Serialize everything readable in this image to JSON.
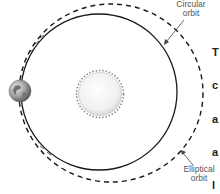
{
  "diagram": {
    "type": "orbit-comparison",
    "labels": {
      "circular": [
        "Circular",
        "orbit"
      ],
      "elliptical": [
        "Elliptical",
        "orbit"
      ]
    },
    "bodies": {
      "sun": {
        "name": "sun",
        "cx": 100,
        "cy": 94,
        "r": 22
      },
      "earth": {
        "name": "earth",
        "cx": 20,
        "cy": 91,
        "r": 11
      }
    },
    "orbits": {
      "circular": {
        "style": "solid",
        "cx": 99,
        "cy": 92,
        "r": 78
      },
      "elliptical": {
        "style": "dashed",
        "cx": 111,
        "cy": 93,
        "rx": 92,
        "ry": 89
      }
    },
    "cut_off_text_column": [
      "T",
      "c",
      "a",
      "a",
      "l",
      "f",
      "t",
      "t",
      "c",
      "e",
      "a"
    ]
  },
  "colors": {
    "orbit_line": "#1a1a1a",
    "label_text": "#555555",
    "sun_fill": "#f2f2f2",
    "earth_fill": "#9a9a9a"
  }
}
